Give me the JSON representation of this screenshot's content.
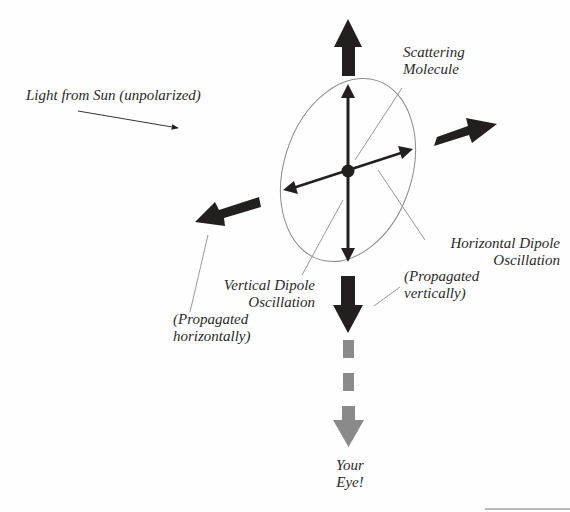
{
  "labels": {
    "sunlight": "Light from Sun (unpolarized)",
    "molecule_line1": "Scattering",
    "molecule_line2": "Molecule",
    "horizontal_line1": "Horizontal Dipole",
    "horizontal_line2": "Oscillation",
    "vertical_line1": "Vertical Dipole",
    "vertical_line2": "Oscillation",
    "prop_vert_line1": "(Propagated",
    "prop_vert_line2": "vertically)",
    "prop_horiz_line1": "(Propagated",
    "prop_horiz_line2": "horizontally)",
    "eye_line1": "Your",
    "eye_line2": "Eye!"
  },
  "colors": {
    "dark_arrow": "#231f1e",
    "gray_arrow": "#8a8a8a",
    "ellipse": "#8c8c8c",
    "leader": "#9a9a9a",
    "text": "#2a2a2a"
  }
}
